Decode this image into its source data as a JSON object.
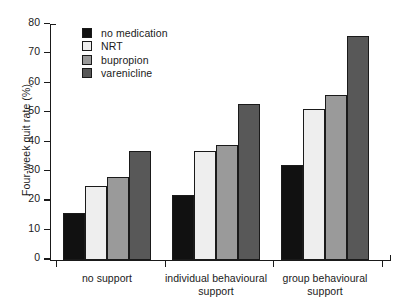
{
  "chart_data": {
    "type": "bar",
    "title": "",
    "xlabel": "",
    "ylabel": "Four-week quit rate (%)",
    "ylim": [
      0,
      80
    ],
    "yticks": [
      0,
      10,
      20,
      30,
      40,
      50,
      60,
      70,
      80
    ],
    "grid": false,
    "legend_position": "top-left",
    "categories": [
      "no support",
      "individual behavioural support",
      "group behavioural support"
    ],
    "category_lines": [
      [
        "no support"
      ],
      [
        "individual behavioural",
        "support"
      ],
      [
        "group behavioural",
        "support"
      ]
    ],
    "series": [
      {
        "name": "no medication",
        "color": "#111111",
        "values": [
          16,
          22,
          32
        ]
      },
      {
        "name": "NRT",
        "color": "#eeeeee",
        "values": [
          25,
          37,
          51
        ]
      },
      {
        "name": "bupropion",
        "color": "#9a9a9a",
        "values": [
          28,
          39,
          56
        ]
      },
      {
        "name": "varenicline",
        "color": "#585858",
        "values": [
          37,
          53,
          76
        ]
      }
    ]
  },
  "axis": {
    "tick_labels": [
      "80",
      "70",
      "60",
      "50",
      "40",
      "30",
      "20",
      "10",
      "0"
    ]
  },
  "colors": {
    "axis": "#1a1a1a",
    "background": "#ffffff"
  }
}
